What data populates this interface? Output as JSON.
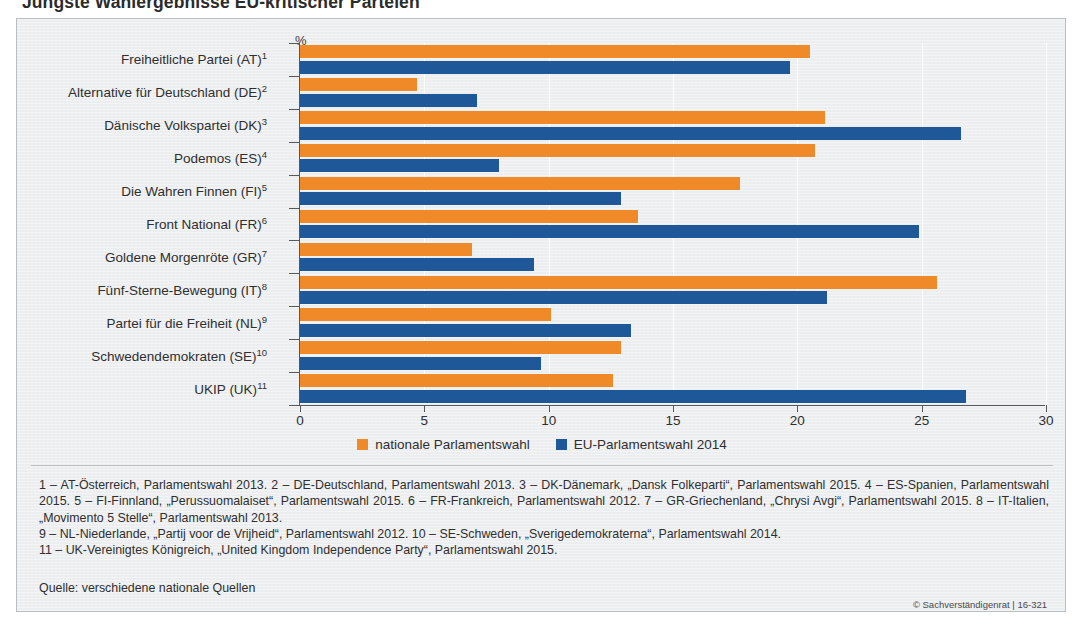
{
  "title": "Jüngste Wahlergebnisse EU-kritischer Parteien",
  "axis_unit": "%",
  "legend": [
    {
      "label": "nationale Parlamentswahl",
      "color": "#f08a28",
      "key": "national"
    },
    {
      "label": "EU-Parlamentswahl 2014",
      "color": "#1f5899",
      "key": "eu"
    }
  ],
  "footnotes": [
    "1 – AT-Österreich, Parlamentswahl 2013.  2 – DE-Deutschland, Parlamentswahl 2013.  3 – DK-Dänemark, „Dansk Folkeparti“, Parlamentswahl 2015.  4 – ES-Spanien, Parlamentswahl 2015.  5 – FI-Finnland, „Perussuomalaiset“, Parlamentswahl 2015.  6 – FR-Frankreich, Parlamentswahl 2012.  7 – GR-Griechenland, „Chrysi Avgi“, Parlamentswahl 2015.  8 – IT-Italien, „Movimento 5 Stelle“, Parlamentswahl 2013.",
    "9 – NL-Niederlande, „Partij voor de Vrijheid“, Parlamentswahl 2012.  10 – SE-Schweden, „Sverigedemokraterna“, Parlamentswahl 2014.",
    "11 – UK-Vereinigtes Königreich, „United Kingdom Independence Party“, Parlamentswahl 2015."
  ],
  "source": "Quelle: verschiedene nationale Quellen",
  "copyright": "© Sachverständigenrat | 16-321",
  "chart_data": {
    "type": "bar",
    "orientation": "horizontal",
    "title": "Jüngste Wahlergebnisse EU-kritischer Parteien",
    "xlabel": "%",
    "ylabel": "",
    "xlim": [
      0,
      30
    ],
    "xticks": [
      0,
      5,
      10,
      15,
      20,
      25,
      30
    ],
    "grid": true,
    "legend_position": "bottom-center",
    "categories": [
      "Freiheitliche Partei (AT)",
      "Alternative für Deutschland (DE)",
      "Dänische Volkspartei (DK)",
      "Podemos (ES)",
      "Die Wahren Finnen (FI)",
      "Front National (FR)",
      "Goldene Morgenröte (GR)",
      "Fünf-Sterne-Bewegung (IT)",
      "Partei für die Freiheit (NL)",
      "Schwedendemokraten (SE)",
      "UKIP (UK)"
    ],
    "category_footnote_marks": [
      "1",
      "2",
      "3",
      "4",
      "5",
      "6",
      "7",
      "8",
      "9",
      "10",
      "11"
    ],
    "series": [
      {
        "name": "nationale Parlamentswahl",
        "color": "#f08a28",
        "values": [
          20.5,
          4.7,
          21.1,
          20.7,
          17.7,
          13.6,
          6.9,
          25.6,
          10.1,
          12.9,
          12.6
        ]
      },
      {
        "name": "EU-Parlamentswahl 2014",
        "color": "#1f5899",
        "values": [
          19.7,
          7.1,
          26.6,
          8.0,
          12.9,
          24.9,
          9.4,
          21.2,
          13.3,
          9.7,
          26.8
        ]
      }
    ]
  }
}
